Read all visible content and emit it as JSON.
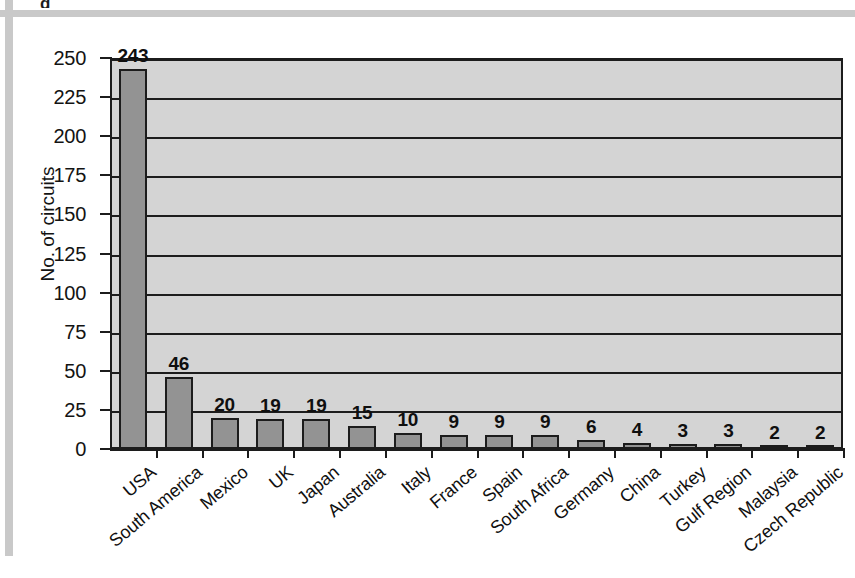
{
  "page": {
    "title_partial": "g",
    "background_color": "#ffffff",
    "frame_rule_color": "#c9c9c9"
  },
  "chart_data": {
    "type": "bar",
    "title": "",
    "xlabel": "",
    "ylabel": "No. of circuits",
    "ylim": [
      0,
      250
    ],
    "ytick_step": 25,
    "yticks": [
      0,
      25,
      50,
      75,
      100,
      125,
      150,
      175,
      200,
      225,
      250
    ],
    "grid": true,
    "legend": "none",
    "categories": [
      "USA",
      "South America",
      "Mexico",
      "UK",
      "Japan",
      "Australia",
      "Italy",
      "France",
      "Spain",
      "South Africa",
      "Germany",
      "China",
      "Turkey",
      "Gulf Region",
      "Malaysia",
      "Czech Republic"
    ],
    "values": [
      243,
      46,
      20,
      19,
      19,
      15,
      10,
      9,
      9,
      9,
      6,
      4,
      3,
      3,
      2,
      2
    ],
    "data_labels": [
      "243",
      "46",
      "20",
      "19",
      "19",
      "15",
      "10",
      "9",
      "9",
      "9",
      "6",
      "4",
      "3",
      "3",
      "2",
      "2"
    ],
    "bar_fill_color": "#939393",
    "bar_border_color": "#1c1c1c",
    "plot_background_color": "#d4d4d4",
    "axis_color": "#1c1c1c"
  }
}
